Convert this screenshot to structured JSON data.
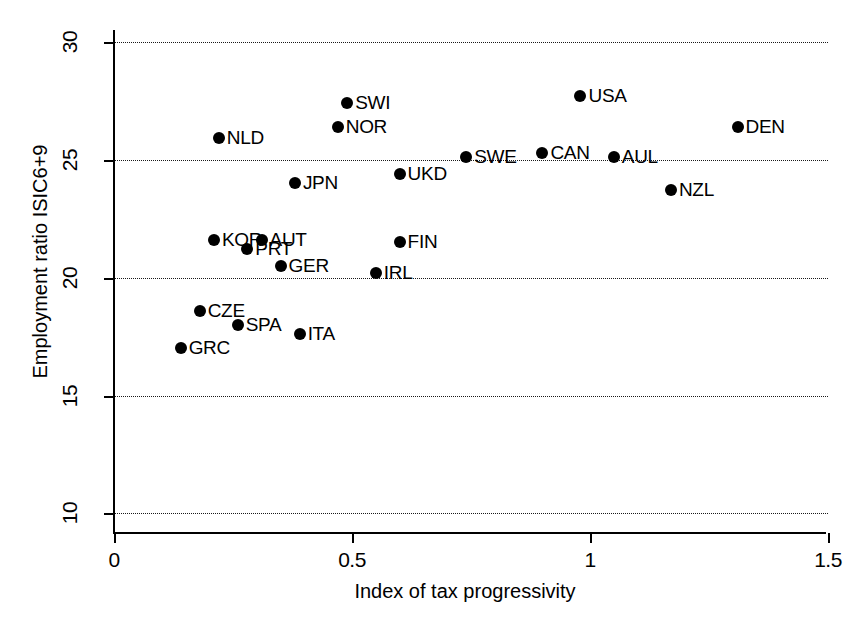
{
  "chart_data": {
    "type": "scatter",
    "title": "",
    "xlabel": "Index of tax progressivity",
    "ylabel": "Employment ratio ISIC6+9",
    "xlim": [
      0,
      1.5
    ],
    "ylim": [
      9.3,
      30.5
    ],
    "grid": true,
    "legend": "none",
    "xticks": [
      0,
      0.5,
      1,
      1.5
    ],
    "xtick_labels": [
      "0",
      "0.5",
      "1",
      "1.5"
    ],
    "yticks": [
      10,
      15,
      20,
      25,
      30
    ],
    "ytick_labels": [
      "10",
      "15",
      "20",
      "25",
      "30"
    ],
    "gridlines_y": [
      10,
      15,
      20,
      25,
      30
    ],
    "points": [
      {
        "label": "GRC",
        "x": 0.14,
        "y": 17.0
      },
      {
        "label": "CZE",
        "x": 0.18,
        "y": 18.6
      },
      {
        "label": "KOR",
        "x": 0.21,
        "y": 21.6
      },
      {
        "label": "NLD",
        "x": 0.22,
        "y": 25.9
      },
      {
        "label": "SPA",
        "x": 0.26,
        "y": 18.0
      },
      {
        "label": "PRT",
        "x": 0.28,
        "y": 21.2
      },
      {
        "label": "AUT",
        "x": 0.31,
        "y": 21.6
      },
      {
        "label": "GER",
        "x": 0.35,
        "y": 20.5
      },
      {
        "label": "JPN",
        "x": 0.38,
        "y": 24.0
      },
      {
        "label": "ITA",
        "x": 0.39,
        "y": 17.6
      },
      {
        "label": "NOR",
        "x": 0.47,
        "y": 26.4
      },
      {
        "label": "SWI",
        "x": 0.49,
        "y": 27.4
      },
      {
        "label": "IRL",
        "x": 0.55,
        "y": 20.2
      },
      {
        "label": "UKD",
        "x": 0.6,
        "y": 24.4
      },
      {
        "label": "FIN",
        "x": 0.6,
        "y": 21.5
      },
      {
        "label": "SWE",
        "x": 0.74,
        "y": 25.1
      },
      {
        "label": "CAN",
        "x": 0.9,
        "y": 25.3
      },
      {
        "label": "USA",
        "x": 0.98,
        "y": 27.7
      },
      {
        "label": "AUL",
        "x": 1.05,
        "y": 25.1
      },
      {
        "label": "NZL",
        "x": 1.17,
        "y": 23.7
      },
      {
        "label": "DEN",
        "x": 1.31,
        "y": 26.4
      }
    ]
  }
}
